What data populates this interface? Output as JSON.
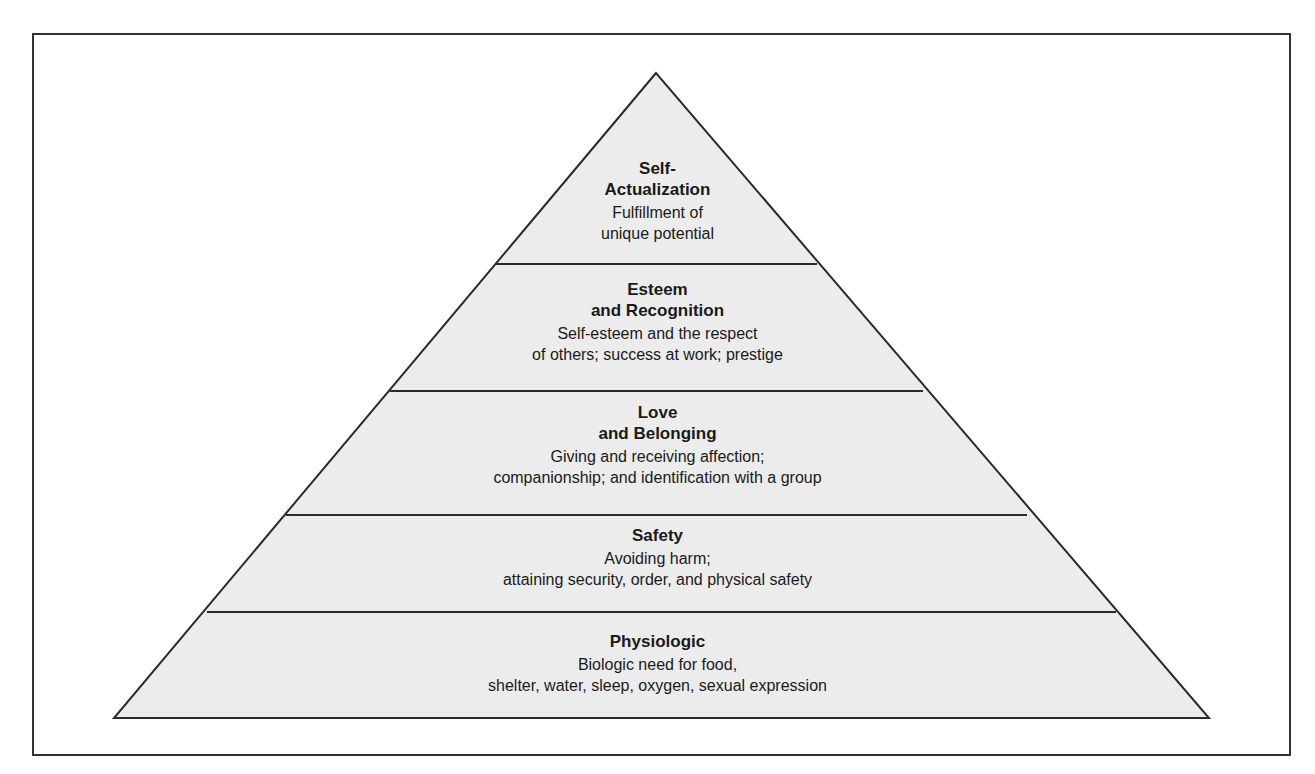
{
  "diagram": {
    "type": "pyramid",
    "colors": {
      "fill": "#ececec",
      "stroke": "#2a2a2a",
      "frame": "#333333",
      "text": "#1a1a1a"
    },
    "tiers": [
      {
        "title_line1": "Self-",
        "title_line2": "Actualization",
        "desc_line1": "Fulfillment of",
        "desc_line2": "unique potential"
      },
      {
        "title_line1": "Esteem",
        "title_line2": "and Recognition",
        "desc_line1": "Self-esteem and the respect",
        "desc_line2": "of others; success at work; prestige"
      },
      {
        "title_line1": "Love",
        "title_line2": "and Belonging",
        "desc_line1": "Giving and receiving affection;",
        "desc_line2": "companionship; and identification with a group"
      },
      {
        "title_line1": "Safety",
        "desc_line1": "Avoiding harm;",
        "desc_line2": "attaining security, order, and physical safety"
      },
      {
        "title_line1": "Physiologic",
        "desc_line1": "Biologic need for food,",
        "desc_line2": "shelter, water, sleep, oxygen, sexual expression"
      }
    ]
  }
}
